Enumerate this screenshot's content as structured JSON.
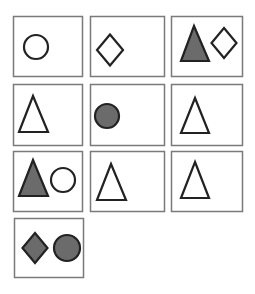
{
  "colors": {
    "background": "#ffffff",
    "panel_border": "#7a7a7a",
    "shape_stroke": "#222222",
    "shape_fill": "#6b6b6b",
    "outline_fill": "#ffffff"
  },
  "panels": [
    {
      "id": "panel-1",
      "x": 13,
      "y": 16,
      "w": 69,
      "h": 60,
      "shapes": [
        {
          "type": "circle",
          "style": "outline",
          "cx": 36,
          "cy": 47,
          "r": 12
        }
      ]
    },
    {
      "id": "panel-2",
      "x": 90,
      "y": 16,
      "w": 74,
      "h": 60,
      "shapes": [
        {
          "type": "diamond",
          "style": "outline",
          "cx": 110,
          "cy": 50,
          "w": 26,
          "h": 31
        }
      ]
    },
    {
      "id": "panel-3",
      "x": 171,
      "y": 16,
      "w": 71,
      "h": 60,
      "shapes": [
        {
          "type": "triangle",
          "style": "filled",
          "apex": [
            194,
            26
          ],
          "base_y": 61,
          "base_x1": 181,
          "base_x2": 209
        },
        {
          "type": "diamond",
          "style": "outline",
          "cx": 224,
          "cy": 43,
          "w": 25,
          "h": 30
        }
      ]
    },
    {
      "id": "panel-4",
      "x": 13,
      "y": 84,
      "w": 69,
      "h": 61,
      "shapes": [
        {
          "type": "triangle",
          "style": "outline",
          "apex": [
            33,
            96
          ],
          "base_y": 132,
          "base_x1": 19,
          "base_x2": 48
        }
      ]
    },
    {
      "id": "panel-5",
      "x": 90,
      "y": 84,
      "w": 74,
      "h": 61,
      "shapes": [
        {
          "type": "circle",
          "style": "filled",
          "cx": 107,
          "cy": 116,
          "r": 12
        }
      ]
    },
    {
      "id": "panel-6",
      "x": 171,
      "y": 84,
      "w": 71,
      "h": 61,
      "shapes": [
        {
          "type": "triangle",
          "style": "outline",
          "apex": [
            195,
            98
          ],
          "base_y": 133,
          "base_x1": 181,
          "base_x2": 209
        }
      ]
    },
    {
      "id": "panel-7",
      "x": 13,
      "y": 151,
      "w": 69,
      "h": 60,
      "shapes": [
        {
          "type": "triangle",
          "style": "filled",
          "apex": [
            33,
            160
          ],
          "base_y": 196,
          "base_x1": 19,
          "base_x2": 48
        },
        {
          "type": "circle",
          "style": "outline",
          "cx": 63,
          "cy": 180,
          "r": 12
        }
      ]
    },
    {
      "id": "panel-8",
      "x": 90,
      "y": 151,
      "w": 74,
      "h": 60,
      "shapes": [
        {
          "type": "triangle",
          "style": "outline",
          "apex": [
            111,
            164
          ],
          "base_y": 200,
          "base_x1": 97,
          "base_x2": 126
        }
      ]
    },
    {
      "id": "panel-9",
      "x": 171,
      "y": 151,
      "w": 71,
      "h": 60,
      "shapes": [
        {
          "type": "triangle",
          "style": "outline",
          "apex": [
            195,
            162
          ],
          "base_y": 198,
          "base_x1": 181,
          "base_x2": 209
        }
      ]
    },
    {
      "id": "panel-10",
      "x": 14,
      "y": 218,
      "w": 69,
      "h": 59,
      "shapes": [
        {
          "type": "diamond",
          "style": "filled",
          "cx": 35,
          "cy": 248,
          "w": 25,
          "h": 30
        },
        {
          "type": "circle",
          "style": "filled",
          "cx": 67,
          "cy": 248,
          "r": 13
        }
      ]
    }
  ]
}
